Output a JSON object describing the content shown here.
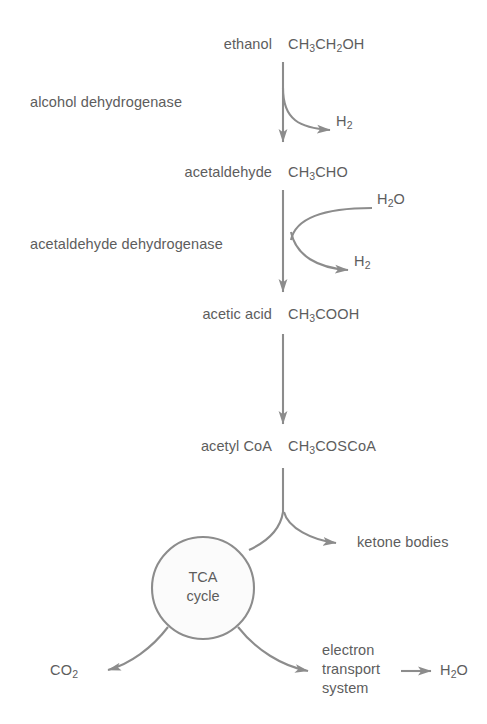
{
  "diagram": {
    "colors": {
      "stroke": "#8c8c8c",
      "text": "#5d5d5d",
      "background": "#ffffff",
      "circle_fill": "#fbfbfb"
    },
    "metabolites": [
      {
        "name": "ethanol",
        "formula_html": "CH<sub class=\"sub\">3</sub>CH<sub class=\"sub\">2</sub>OH"
      },
      {
        "name": "acetaldehyde",
        "formula_html": "CH<sub class=\"sub\">3</sub>CHO"
      },
      {
        "name": "acetic acid",
        "formula_html": "CH<sub class=\"sub\">3</sub>COOH"
      },
      {
        "name": "acetyl CoA",
        "formula_html": "CH<sub class=\"sub\">3</sub>COSCoA"
      }
    ],
    "enzymes": [
      {
        "name": "alcohol dehydrogenase"
      },
      {
        "name": "acetaldehyde dehydrogenase"
      }
    ],
    "side_products": [
      {
        "label_html": "H<sub class=\"sub\">2</sub>",
        "role": "product",
        "step": "alcohol dehydrogenase"
      },
      {
        "label_html": "H<sub class=\"sub\">2</sub>O",
        "role": "substrate",
        "step": "acetaldehyde dehydrogenase"
      },
      {
        "label_html": "H<sub class=\"sub\">2</sub>",
        "role": "product",
        "step": "acetaldehyde dehydrogenase"
      }
    ],
    "cycle": {
      "line1": "TCA",
      "line2": "cycle"
    },
    "branches": [
      {
        "label_html": "ketone bodies"
      },
      {
        "label_html": "CO<sub class=\"sub\">2</sub>"
      },
      {
        "label_line1": "electron",
        "label_line2": "transport",
        "label_line3": "system"
      },
      {
        "label_html": "H<sub class=\"sub\">2</sub>O"
      }
    ]
  }
}
